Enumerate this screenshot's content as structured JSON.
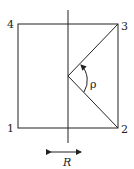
{
  "diagram": {
    "corners": [
      {
        "id": "1",
        "label": "1"
      },
      {
        "id": "2",
        "label": "2"
      },
      {
        "id": "3",
        "label": "3"
      },
      {
        "id": "4",
        "label": "4"
      }
    ],
    "angle_label": "ρ",
    "displacement_label": "R",
    "colors": {
      "stroke": "#222222",
      "background": "#ffffff"
    }
  }
}
